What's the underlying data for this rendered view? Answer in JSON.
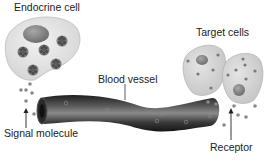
{
  "diagram": {
    "labels": {
      "endocrine_cell": "Endocrine cell",
      "target_cells": "Target cells",
      "blood_vessel": "Blood vessel",
      "signal_molecule": "Signal molecule",
      "receptor": "Receptor"
    },
    "colors": {
      "cell_fill": "#e6e6e6",
      "cell_stroke": "#bdbdbd",
      "nucleus": "#8a8a8a",
      "vesicle": "#6e6e6e",
      "dot": "#8c8c8c",
      "vessel_dark": "#2a2a2a",
      "vessel_light": "#7a7a7a",
      "text": "#222222"
    }
  }
}
